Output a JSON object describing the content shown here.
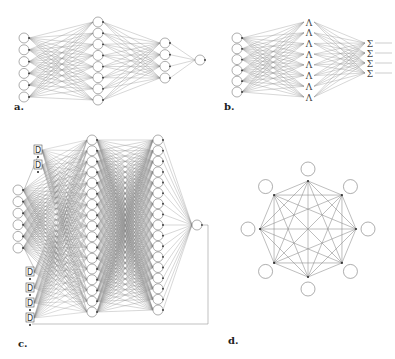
{
  "figure": {
    "panels": [
      {
        "id": "a",
        "label": "a.",
        "label_pos": [
          14,
          110
        ],
        "description": "feed-forward neural network",
        "layers": [
          {
            "x": 24,
            "y0": 38,
            "y1": 97,
            "count": 6,
            "r": 5,
            "type": "circle"
          },
          {
            "x": 98,
            "y0": 22,
            "y1": 100,
            "count": 8,
            "r": 5,
            "type": "circle"
          },
          {
            "x": 165,
            "y0": 43,
            "y1": 78,
            "count": 4,
            "r": 5,
            "type": "circle"
          },
          {
            "x": 200,
            "y0": 60,
            "y1": 60,
            "count": 1,
            "r": 5,
            "type": "circle"
          }
        ]
      },
      {
        "id": "b",
        "label": "b.",
        "label_pos": [
          224,
          110
        ],
        "description": "network with lambda hidden units and sigma outputs",
        "layers": [
          {
            "x": 237,
            "y0": 38,
            "y1": 92,
            "count": 6,
            "r": 5,
            "type": "circle"
          },
          {
            "x": 309,
            "y0": 22,
            "y1": 97,
            "count": 8,
            "r": 5,
            "type": "glyph",
            "glyph": "Λ"
          },
          {
            "x": 370,
            "y0": 43,
            "y1": 73,
            "count": 4,
            "r": 5,
            "type": "glyph",
            "glyph": "Σ"
          }
        ],
        "output_lines_to_x": 392,
        "stray_node": {
          "x": 205,
          "y": 60,
          "r": 5
        }
      },
      {
        "id": "c",
        "label": "c.",
        "label_pos": [
          18,
          347
        ],
        "description": "recurrent network with delay units feeding back output",
        "delay_label": "D",
        "delays_top": [
          [
            38,
            150
          ],
          [
            38,
            165
          ]
        ],
        "delays_bottom": [
          [
            30,
            272
          ],
          [
            30,
            288
          ],
          [
            30,
            303
          ],
          [
            30,
            318
          ]
        ],
        "layers": [
          {
            "x": 18,
            "y0": 190,
            "y1": 248,
            "count": 6,
            "r": 5,
            "type": "circle"
          },
          {
            "x": 92,
            "y0": 140,
            "y1": 312,
            "count": 17,
            "r": 5,
            "type": "circle"
          },
          {
            "x": 158,
            "y0": 140,
            "y1": 310,
            "count": 17,
            "r": 5,
            "type": "circle"
          },
          {
            "x": 197,
            "y0": 225,
            "y1": 225,
            "count": 1,
            "r": 5,
            "type": "circle"
          }
        ],
        "feedback": {
          "right_x": 208,
          "from_y": 225,
          "bottom_y": 324,
          "left_x": 32
        }
      },
      {
        "id": "d",
        "label": "d.",
        "label_pos": [
          228,
          344
        ],
        "description": "fully connected Hopfield network with 8 nodes",
        "center": [
          308,
          229
        ],
        "vertex_radius": 48,
        "node_offset": 12,
        "count": 8,
        "r": 7
      }
    ]
  }
}
